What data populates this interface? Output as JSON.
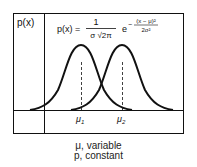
{
  "diagram": {
    "y_axis_label": "p(x)",
    "formula": {
      "lhs": "p(x) =",
      "numerator": "1",
      "denominator": "σ √2π",
      "exp_base": "e",
      "exp_sign": "−",
      "exp_numerator": "(x − μ)²",
      "exp_denominator": "2σ²"
    },
    "curves": [
      {
        "name": "curve-1",
        "mean_label": "μ",
        "mean_sub": "1"
      },
      {
        "name": "curve-2",
        "mean_label": "μ",
        "mean_sub": "2"
      }
    ],
    "caption_line1": "μ, variable",
    "caption_line2": "p, constant",
    "colors": {
      "line": "#111111",
      "background": "#ffffff"
    }
  }
}
